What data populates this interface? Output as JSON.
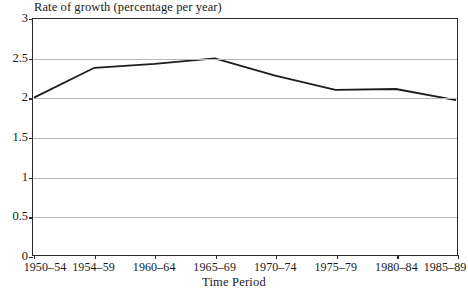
{
  "chart_data": {
    "type": "line",
    "title": "Rate of growth (percentage per year)",
    "xlabel": "Time Period",
    "ylabel": "",
    "categories": [
      "1950–54",
      "1954–59",
      "1960–64",
      "1965–69",
      "1970–74",
      "1975–79",
      "1980–84",
      "1985–89"
    ],
    "values": [
      2.0,
      2.38,
      2.43,
      2.5,
      2.28,
      2.1,
      2.11,
      1.97
    ],
    "series": [
      {
        "name": "Rate of growth",
        "values": [
          2.0,
          2.38,
          2.43,
          2.5,
          2.28,
          2.1,
          2.11,
          1.97
        ]
      }
    ],
    "ylim": [
      0,
      3
    ],
    "yticks": [
      0,
      0.5,
      1,
      1.5,
      2,
      2.5,
      3
    ],
    "ytick_labels": [
      "0",
      "0.5",
      "1",
      "1.5",
      "2",
      "2.5",
      "3"
    ],
    "grid": true,
    "legend": "none",
    "line_color": "#1c1c1c",
    "grid_color": "#b9b9b9",
    "frame_color": "#2b2b2b",
    "background": "#ffffff"
  }
}
